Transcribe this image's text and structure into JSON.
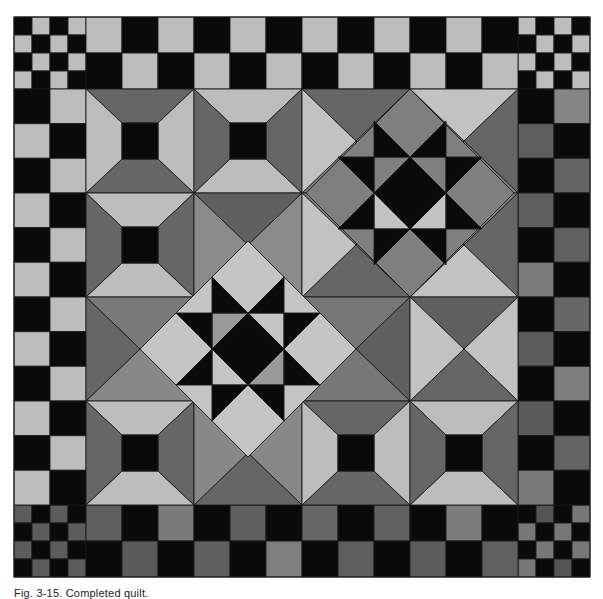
{
  "figure": {
    "caption": "Fig. 3-15. Completed quilt."
  },
  "palette": {
    "black": "#0a0a0a",
    "light": "#bdbdbd",
    "lighter": "#c6c6c6",
    "mid": "#8a8a8a",
    "dark": "#666666",
    "darker": "#5c5c5c",
    "stroke": "#1a1a1a"
  },
  "quilt": {
    "bounds": {
      "x": 14,
      "y": 17,
      "width": 576,
      "height": 560
    },
    "inner": {
      "x": 86,
      "y": 89,
      "cols": [
        86,
        194,
        302,
        410,
        518
      ],
      "rows": [
        89,
        193,
        297,
        401,
        505
      ]
    },
    "corner_blocks": [
      {
        "name": "corner-top-left",
        "x": 14,
        "y": 17,
        "cells": [
          [
            "#0a0a0a",
            "#bdbdbd",
            "#0a0a0a",
            "#bdbdbd"
          ],
          [
            "#bdbdbd",
            "#0a0a0a",
            "#bdbdbd",
            "#0a0a0a"
          ],
          [
            "#0a0a0a",
            "#bdbdbd",
            "#0a0a0a",
            "#bdbdbd"
          ],
          [
            "#bdbdbd",
            "#0a0a0a",
            "#bdbdbd",
            "#0a0a0a"
          ]
        ]
      },
      {
        "name": "corner-top-right",
        "x": 518,
        "y": 17,
        "cells": [
          [
            "#bdbdbd",
            "#0a0a0a",
            "#bdbdbd",
            "#0a0a0a"
          ],
          [
            "#0a0a0a",
            "#bdbdbd",
            "#0a0a0a",
            "#bdbdbd"
          ],
          [
            "#bdbdbd",
            "#0a0a0a",
            "#bdbdbd",
            "#0a0a0a"
          ],
          [
            "#0a0a0a",
            "#bdbdbd",
            "#0a0a0a",
            "#bdbdbd"
          ]
        ]
      },
      {
        "name": "corner-bottom-left",
        "x": 14,
        "y": 505,
        "cells": [
          [
            "#5c5c5c",
            "#0a0a0a",
            "#5c5c5c",
            "#0a0a0a"
          ],
          [
            "#0a0a0a",
            "#5c5c5c",
            "#0a0a0a",
            "#5c5c5c"
          ],
          [
            "#5c5c5c",
            "#0a0a0a",
            "#5c5c5c",
            "#0a0a0a"
          ],
          [
            "#0a0a0a",
            "#5c5c5c",
            "#0a0a0a",
            "#5c5c5c"
          ]
        ]
      },
      {
        "name": "corner-bottom-right",
        "x": 518,
        "y": 505,
        "cells": [
          [
            "#0a0a0a",
            "#555555",
            "#0a0a0a",
            "#777777"
          ],
          [
            "#777777",
            "#0a0a0a",
            "#777777",
            "#0a0a0a"
          ],
          [
            "#0a0a0a",
            "#777777",
            "#0a0a0a",
            "#777777"
          ],
          [
            "#777777",
            "#0a0a0a",
            "#555555",
            "#0a0a0a"
          ]
        ]
      }
    ],
    "borders": {
      "top": {
        "x": 86,
        "y": 17,
        "cell": 36,
        "rows": [
          [
            "#bdbdbd",
            "#0a0a0a",
            "#bdbdbd",
            "#0a0a0a",
            "#bdbdbd",
            "#0a0a0a",
            "#bdbdbd",
            "#0a0a0a",
            "#bdbdbd",
            "#0a0a0a",
            "#bdbdbd",
            "#0a0a0a"
          ],
          [
            "#0a0a0a",
            "#bdbdbd",
            "#0a0a0a",
            "#bdbdbd",
            "#0a0a0a",
            "#bdbdbd",
            "#0a0a0a",
            "#bdbdbd",
            "#0a0a0a",
            "#bdbdbd",
            "#0a0a0a",
            "#bdbdbd"
          ]
        ]
      },
      "bottom": {
        "x": 86,
        "y": 505,
        "cell": 36,
        "rows": [
          [
            "#5e5e5e",
            "#0a0a0a",
            "#7a7a7a",
            "#0a0a0a",
            "#5e5e5e",
            "#0a0a0a",
            "#666666",
            "#0a0a0a",
            "#606060",
            "#0a0a0a",
            "#7c7c7c",
            "#0a0a0a"
          ],
          [
            "#0a0a0a",
            "#5a5a5a",
            "#0a0a0a",
            "#5f5f5f",
            "#0a0a0a",
            "#7e7e7e",
            "#0a0a0a",
            "#5e5e5e",
            "#0a0a0a",
            "#5c5c5c",
            "#0a0a0a",
            "#606060"
          ]
        ]
      },
      "left": {
        "x": 14,
        "y": 89,
        "cell_w": 36,
        "cell_h": 34.667,
        "rows": [
          [
            "#0a0a0a",
            "#bdbdbd"
          ],
          [
            "#bdbdbd",
            "#0a0a0a"
          ],
          [
            "#0a0a0a",
            "#bdbdbd"
          ],
          [
            "#bdbdbd",
            "#0a0a0a"
          ],
          [
            "#0a0a0a",
            "#bdbdbd"
          ],
          [
            "#bdbdbd",
            "#0a0a0a"
          ],
          [
            "#0a0a0a",
            "#bdbdbd"
          ],
          [
            "#bdbdbd",
            "#0a0a0a"
          ],
          [
            "#0a0a0a",
            "#bdbdbd"
          ],
          [
            "#bdbdbd",
            "#0a0a0a"
          ],
          [
            "#0a0a0a",
            "#bdbdbd"
          ],
          [
            "#bdbdbd",
            "#0a0a0a"
          ]
        ]
      },
      "right": {
        "x": 518,
        "y": 89,
        "cell_w": 36,
        "cell_h": 34.667,
        "rows": [
          [
            "#0a0a0a",
            "#858585"
          ],
          [
            "#5f5f5f",
            "#0a0a0a"
          ],
          [
            "#0a0a0a",
            "#646464"
          ],
          [
            "#5d5d5d",
            "#0a0a0a"
          ],
          [
            "#0a0a0a",
            "#606060"
          ],
          [
            "#7b7b7b",
            "#0a0a0a"
          ],
          [
            "#0a0a0a",
            "#666666"
          ],
          [
            "#5c5c5c",
            "#0a0a0a"
          ],
          [
            "#0a0a0a",
            "#7d7d7d"
          ],
          [
            "#5a5a5a",
            "#0a0a0a"
          ],
          [
            "#0a0a0a",
            "#646464"
          ],
          [
            "#7a7a7a",
            "#0a0a0a"
          ]
        ]
      }
    },
    "blocks": [
      {
        "type": "spool",
        "row": 0,
        "col": 0,
        "tb": "#666666",
        "lr": "#bdbdbd",
        "center": "#0a0a0a"
      },
      {
        "type": "spool",
        "row": 0,
        "col": 1,
        "tb": "#bdbdbd",
        "lr": "#666666",
        "center": "#0a0a0a"
      },
      {
        "type": "hst4",
        "row": 0,
        "col": 2,
        "top": "#666666",
        "right": "#888888",
        "bottom": "#7f7f7f",
        "left": "#c2c2c2"
      },
      {
        "type": "hst4",
        "row": 0,
        "col": 3,
        "top": "#c2c2c2",
        "right": "#666666",
        "bottom": "#7f7f7f",
        "left": "#888888"
      },
      {
        "type": "spool",
        "row": 1,
        "col": 0,
        "tb": "#bdbdbd",
        "lr": "#666666",
        "center": "#0a0a0a"
      },
      {
        "type": "hst4",
        "row": 1,
        "col": 1,
        "top": "#5f5f5f",
        "right": "#8a8a8a",
        "bottom": "#c4c4c4",
        "left": "#8a8a8a"
      },
      {
        "type": "hst4",
        "row": 1,
        "col": 2,
        "top": "#7f7f7f",
        "right": "#888888",
        "bottom": "#666666",
        "left": "#c2c2c2"
      },
      {
        "type": "hst4",
        "row": 1,
        "col": 3,
        "top": "#7f7f7f",
        "right": "#666666",
        "bottom": "#c2c2c2",
        "left": "#888888"
      },
      {
        "type": "hst4",
        "row": 2,
        "col": 0,
        "top": "#7a7a7a",
        "right": "#c4c4c4",
        "bottom": "#888888",
        "left": "#666666"
      },
      {
        "type": "hst4",
        "row": 2,
        "col": 1,
        "top": "#c4c4c4",
        "right": "#c4c4c4",
        "bottom": "#c4c4c4",
        "left": "#c4c4c4"
      },
      {
        "type": "hst4",
        "row": 2,
        "col": 2,
        "top": "#777777",
        "right": "#5f5f5f",
        "bottom": "#777777",
        "left": "#c4c4c4"
      },
      {
        "type": "hst4",
        "row": 2,
        "col": 3,
        "top": "#5f5f5f",
        "right": "#c2c2c2",
        "bottom": "#666666",
        "left": "#c2c2c2"
      },
      {
        "type": "spool",
        "row": 3,
        "col": 0,
        "tb": "#bdbdbd",
        "lr": "#666666",
        "center": "#0a0a0a"
      },
      {
        "type": "hst4",
        "row": 3,
        "col": 1,
        "top": "#c4c4c4",
        "right": "#888888",
        "bottom": "#666666",
        "left": "#888888"
      },
      {
        "type": "spool",
        "row": 3,
        "col": 2,
        "tb": "#666666",
        "lr": "#bdbdbd",
        "center": "#0a0a0a"
      },
      {
        "type": "spool",
        "row": 3,
        "col": 3,
        "tb": "#bdbdbd",
        "lr": "#666666",
        "center": "#0a0a0a"
      }
    ],
    "stars": [
      {
        "name": "ohio-star-center-left",
        "cx": 248,
        "cy": 349,
        "half_diag": 108,
        "unit": 36,
        "diamond": "#c4c4c4",
        "points": "#0a0a0a",
        "center": "#0a0a0a",
        "center_corners": [
          "#999999",
          "#c4c4c4",
          "#999999",
          "#c4c4c4"
        ],
        "outer_corner": "#c4c4c4"
      },
      {
        "name": "ohio-star-top-right",
        "cx": 410,
        "cy": 193,
        "half_diag": 104,
        "unit": 36,
        "diamond": "#7f7f7f",
        "points": "#0a0a0a",
        "center": "#0a0a0a",
        "center_corners": [
          "#7f7f7f",
          "#7f7f7f",
          "#c2c2c2",
          "#c2c2c2"
        ],
        "outer_corner": "#8a8a8a"
      }
    ]
  }
}
